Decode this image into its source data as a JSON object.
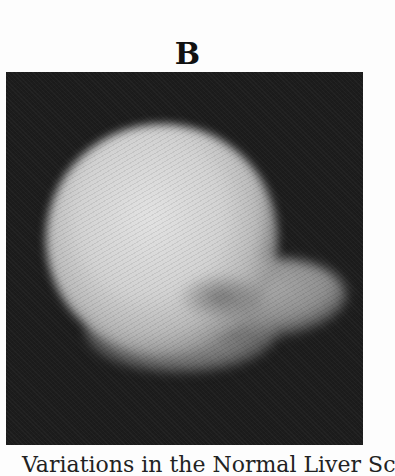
{
  "figure": {
    "panel_label": "B",
    "image_description": "Grayscale scintigraphic liver scan: bright rounded blob with a lobe extending to the right on a dark background",
    "caption": "Variations in the Normal Liver Sc"
  }
}
